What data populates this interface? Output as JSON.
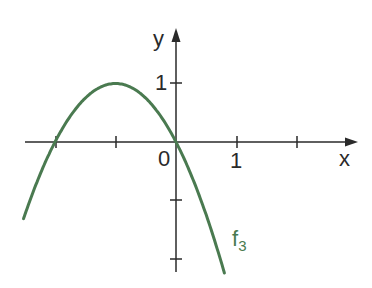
{
  "chart_data": {
    "type": "line",
    "title": "",
    "xlabel": "x",
    "ylabel": "y",
    "x_tick_labels": {
      "0": "0",
      "1": "1"
    },
    "y_tick_labels": {
      "1": "1"
    },
    "x_ticks": [
      -2,
      -1,
      0,
      1,
      2
    ],
    "y_ticks": [
      1,
      -1,
      -2
    ],
    "xlim": [
      -2.6,
      2.9
    ],
    "ylim": [
      -2.2,
      1.8
    ],
    "grid": false,
    "series": [
      {
        "name": "f3",
        "label_main": "f",
        "label_sub": "3",
        "color": "#4a7a50",
        "formula": "f(x) = -x^2 - 2x",
        "x": [
          -2.5,
          -2,
          -1.5,
          -1,
          -0.5,
          0,
          0.5,
          0.8
        ],
        "values": [
          -1.25,
          0,
          0.75,
          1,
          0.75,
          0,
          -1.25,
          -2.24
        ]
      }
    ]
  },
  "labels": {
    "x_axis": "x",
    "y_axis": "y",
    "origin": "0",
    "x_one": "1",
    "y_one": "1",
    "curve_main": "f",
    "curve_sub": "3"
  }
}
